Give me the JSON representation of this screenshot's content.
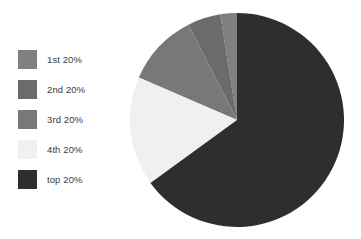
{
  "chart_data": {
    "type": "pie",
    "title": "",
    "categories": [
      "1st 20%",
      "2nd 20%",
      "3rd 20%",
      "4th 20%",
      "top 20%"
    ],
    "values": [
      2.5,
      5,
      11,
      16.5,
      65
    ],
    "units": "percent of total",
    "legend_position": "left",
    "grid": false,
    "start_angle_deg": 0,
    "direction": "counterclockwise",
    "slices": [
      {
        "label": "1st 20%",
        "value": 2.5,
        "color": "#808080",
        "start_deg": 0,
        "end_deg": 9
      },
      {
        "label": "2nd 20%",
        "value": 5,
        "color": "#6b6b6b",
        "start_deg": 9,
        "end_deg": 27
      },
      {
        "label": "3rd 20%",
        "value": 11,
        "color": "#787878",
        "start_deg": 27,
        "end_deg": 66.6
      },
      {
        "label": "4th 20%",
        "value": 16.5,
        "color": "#f0f0f0",
        "start_deg": 66.6,
        "end_deg": 126
      },
      {
        "label": "top 20%",
        "value": 65,
        "color": "#2e2e2e",
        "start_deg": 126,
        "end_deg": 360
      }
    ]
  },
  "legend": {
    "items": [
      {
        "label": "1st 20%",
        "color": "#808080"
      },
      {
        "label": "2nd 20%",
        "color": "#6b6b6b"
      },
      {
        "label": "3rd 20%",
        "color": "#787878"
      },
      {
        "label": "4th 20%",
        "color": "#f0f0f0"
      },
      {
        "label": "top 20%",
        "color": "#2e2e2e"
      }
    ]
  },
  "colors": {
    "background": "#ffffff",
    "label_text": "#3b3b3b",
    "slice_1st": "#808080",
    "slice_2nd": "#6b6b6b",
    "slice_3rd": "#787878",
    "slice_4th": "#f0f0f0",
    "slice_top": "#2e2e2e"
  }
}
